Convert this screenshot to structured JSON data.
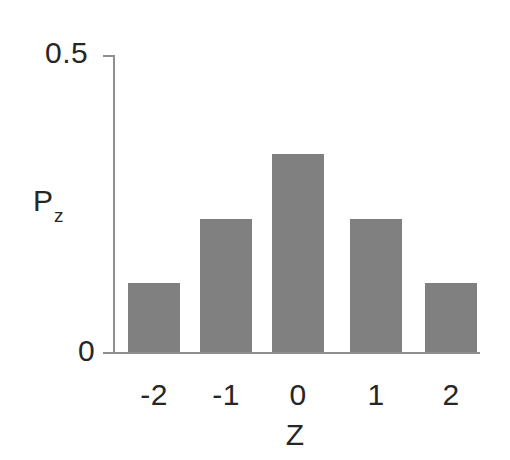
{
  "chart_data": {
    "type": "bar",
    "title": "",
    "subtitle": "",
    "xlabel": "Z",
    "ylabel": "P_z",
    "ylabel_base": "P",
    "ylabel_sub": "z",
    "categories": [
      "-2",
      "-1",
      "0",
      "1",
      "2"
    ],
    "values": [
      0.116,
      0.224,
      0.333,
      0.224,
      0.116
    ],
    "ylim": [
      0,
      0.5
    ],
    "ytick_labels": [
      "0",
      "0.5"
    ],
    "ytick_values": [
      0,
      0.5
    ],
    "xtick_labels": [
      "-2",
      "-1",
      "0",
      "1",
      "2"
    ],
    "grid": false,
    "legend": false,
    "legend_position": "none",
    "bar_color": "#808080",
    "axis_color": "#8f8f8f",
    "text_color": "#262626",
    "background_color": "#ffffff",
    "annotations": []
  },
  "axes": {
    "y_top_label": "0.5",
    "y_bottom_label": "0",
    "x_title": "Z",
    "y_title_base": "P",
    "y_title_sub": "z"
  },
  "bars": [
    {
      "category": "-2",
      "value": 0.116,
      "label": "-2"
    },
    {
      "category": "-1",
      "value": 0.224,
      "label": "-1"
    },
    {
      "category": "0",
      "value": 0.333,
      "label": "0"
    },
    {
      "category": "1",
      "value": 0.224,
      "label": "1"
    },
    {
      "category": "2",
      "value": 0.116,
      "label": "2"
    }
  ]
}
